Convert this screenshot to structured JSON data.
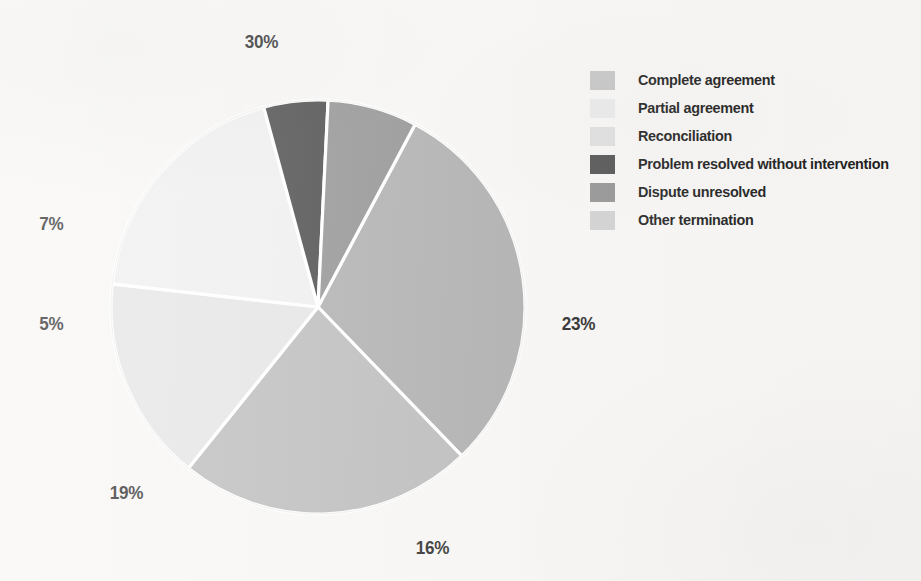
{
  "chart_data": {
    "type": "pie",
    "title": "",
    "subtitle": "",
    "xlabel": "",
    "ylabel": "",
    "grid": false,
    "legend_position": "right",
    "value_unit": "%",
    "total": 100,
    "start_angle_deg": -62,
    "direction": "clockwise",
    "separator_color": "#ffffff",
    "background_color": "#f7f6f4",
    "label_color": "#1d1d1d",
    "categories": [
      "Complete agreement",
      "Partial agreement",
      "Reconciliation",
      "Problem resolved without intervention",
      "Dispute unresolved",
      "Other termination"
    ],
    "values": [
      30,
      16,
      19,
      5,
      7,
      23
    ],
    "colors": [
      "#a9a9a9",
      "#e3e3e3",
      "#eeeeee",
      "#3c3c3c",
      "#8b8b8b",
      "#b7b7b7"
    ],
    "slices": [
      {
        "label": "Complete agreement",
        "value": 30,
        "display": "30%",
        "color": "#a9a9a9"
      },
      {
        "label": "Other termination",
        "value": 23,
        "display": "23%",
        "color": "#b7b7b7"
      },
      {
        "label": "Partial agreement",
        "value": 16,
        "display": "16%",
        "color": "#e3e3e3"
      },
      {
        "label": "Reconciliation",
        "value": 19,
        "display": "19%",
        "color": "#eeeeee"
      },
      {
        "label": "Problem resolved without intervention",
        "value": 5,
        "display": "5%",
        "color": "#3c3c3c"
      },
      {
        "label": "Dispute unresolved",
        "value": 7,
        "display": "7%",
        "color": "#8b8b8b"
      }
    ]
  },
  "pie": {
    "center_x": 318,
    "center_y": 307,
    "radius": 207,
    "labels": [
      {
        "text": "30%",
        "x": 243,
        "y": 31,
        "name": "pie-label-30"
      },
      {
        "text": "23%",
        "x": 560,
        "y": 313,
        "name": "pie-label-23"
      },
      {
        "text": "16%",
        "x": 414,
        "y": 537,
        "name": "pie-label-16"
      },
      {
        "text": "19%",
        "x": 108,
        "y": 482,
        "name": "pie-label-19"
      },
      {
        "text": "5%",
        "x": 38,
        "y": 313,
        "name": "pie-label-5"
      },
      {
        "text": "7%",
        "x": 38,
        "y": 213,
        "name": "pie-label-7"
      }
    ]
  },
  "legend": {
    "items": [
      {
        "label": "Complete agreement",
        "color": "#c3c3c3"
      },
      {
        "label": "Partial agreement",
        "color": "#e9e9e9"
      },
      {
        "label": "Reconciliation",
        "color": "#dedede"
      },
      {
        "label": "Problem resolved without intervention",
        "color": "#4b4b4b"
      },
      {
        "label": "Dispute unresolved",
        "color": "#8f8f8f"
      },
      {
        "label": "Other termination",
        "color": "#cfcfcf"
      }
    ]
  }
}
